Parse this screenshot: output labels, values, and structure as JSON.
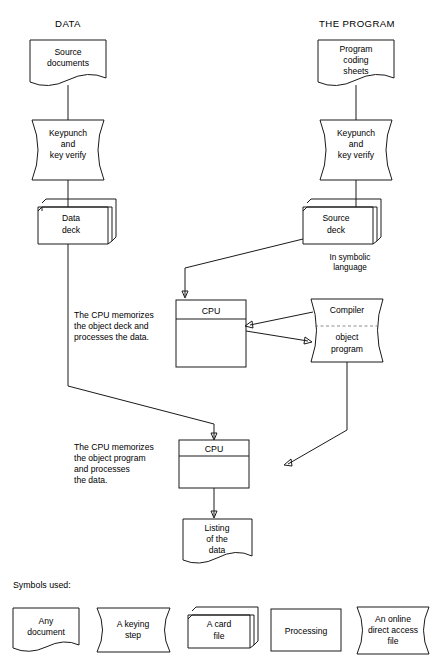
{
  "figure": {
    "title_left": "DATA",
    "title_right": "THE PROGRAM"
  },
  "nodes": {
    "source_documents": {
      "lines": [
        "Source",
        "documents"
      ],
      "symbol": "document"
    },
    "keypunch_left": {
      "lines": [
        "Keypunch",
        "and",
        "key verify"
      ],
      "symbol": "keying-step"
    },
    "data_deck": {
      "lines": [
        "Data",
        "deck"
      ],
      "symbol": "card-file"
    },
    "program_coding_sheets": {
      "lines": [
        "Program",
        "coding",
        "sheets"
      ],
      "symbol": "document"
    },
    "keypunch_right": {
      "lines": [
        "Keypunch",
        "and",
        "key verify"
      ],
      "symbol": "keying-step"
    },
    "source_deck": {
      "lines": [
        "Source",
        "deck"
      ],
      "symbol": "card-file"
    },
    "source_deck_note": {
      "lines": [
        "In symbolic",
        "language"
      ]
    },
    "cpu_one": {
      "header": "CPU",
      "symbol": "processing"
    },
    "cpu_two": {
      "header": "CPU",
      "symbol": "processing"
    },
    "compiler": {
      "lines_top": [
        "Compiler"
      ],
      "lines_bottom": [
        "object",
        "program"
      ],
      "symbol": "online-direct-access-file"
    },
    "listing": {
      "lines": [
        "Listing",
        "of the",
        "data"
      ],
      "symbol": "document"
    }
  },
  "captions": {
    "cpu_one": [
      "The CPU memorizes",
      "the object deck and",
      "processes the data."
    ],
    "cpu_two": [
      "The CPU memorizes",
      "the object program",
      "and processes",
      "the data."
    ]
  },
  "legend": {
    "title": "Symbols used:",
    "items": [
      {
        "lines": [
          "Any",
          "document"
        ],
        "symbol": "document"
      },
      {
        "lines": [
          "A keying",
          "step"
        ],
        "symbol": "keying-step"
      },
      {
        "lines": [
          "A card",
          "file"
        ],
        "symbol": "card-file"
      },
      {
        "lines": [
          "Processing"
        ],
        "symbol": "processing"
      },
      {
        "lines": [
          "An online",
          "direct access",
          "file"
        ],
        "symbol": "online-direct-access-file"
      }
    ]
  },
  "style": {
    "stroke": "#1a1a1a",
    "background": "#ffffff"
  }
}
